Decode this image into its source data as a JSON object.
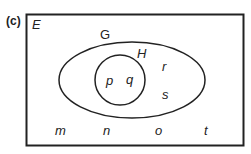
{
  "figure_label": "(c)",
  "universal_set": {
    "label": "E"
  },
  "sets": [
    {
      "name": "G",
      "label": "G",
      "shape": "ellipse"
    },
    {
      "name": "H",
      "label": "H",
      "shape": "circle",
      "subset_of": "G"
    }
  ],
  "elements": {
    "in_H": [
      "p",
      "q"
    ],
    "in_G_only": [
      "r",
      "s"
    ],
    "outside": [
      "m",
      "n",
      "o",
      "t"
    ]
  },
  "colors": {
    "stroke": "#222222",
    "background": "#ffffff"
  }
}
